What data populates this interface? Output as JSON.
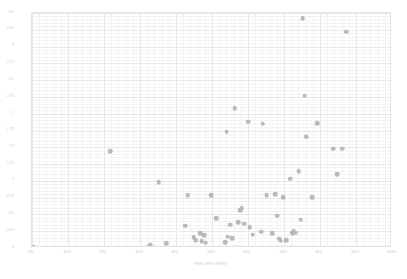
{
  "chart_data": {
    "type": "scatter",
    "title": "",
    "xlabel": "PERCENT WHITE",
    "ylabel": "CEMETERIES PER MILLION RESIDENTS",
    "xlim": [
      0,
      1
    ],
    "ylim": [
      0,
      3.5
    ],
    "xticks": [
      0,
      0.1,
      0.2,
      0.3,
      0.4,
      0.5,
      0.6,
      0.7,
      0.8,
      0.9,
      1
    ],
    "xticklabels": [
      "0%",
      "10%",
      "20%",
      "30%",
      "40%",
      "50%",
      "60%",
      "70%",
      "80%",
      "90%",
      "100%"
    ],
    "yticks": [
      0,
      0.25,
      0.5,
      0.75,
      1,
      1.25,
      1.5,
      1.75,
      2,
      2.25,
      2.5,
      2.75,
      3,
      3.25,
      3.5
    ],
    "yticklabels": [
      "0",
      "0.25",
      "0.5",
      "0.75",
      "1",
      "1.25",
      "1.5",
      "1.75",
      "2",
      "2.25",
      "2.5",
      "2.75",
      "3",
      "3.25",
      "3.5"
    ],
    "grid": true,
    "minor_grid": true,
    "legend": false,
    "marker_color": "#b6b9bd",
    "marker_size": 4.6,
    "series": [
      {
        "name": "states",
        "points": [
          [
            0.005,
            0.02
          ],
          [
            0.218,
            1.44
          ],
          [
            0.325,
            0.02
          ],
          [
            0.328,
            0.05
          ],
          [
            0.352,
            0.98
          ],
          [
            0.372,
            0.07
          ],
          [
            0.425,
            0.33
          ],
          [
            0.432,
            0.79
          ],
          [
            0.449,
            0.16
          ],
          [
            0.455,
            0.12
          ],
          [
            0.468,
            0.22
          ],
          [
            0.471,
            0.1
          ],
          [
            0.478,
            0.19
          ],
          [
            0.482,
            0.08
          ],
          [
            0.497,
            0.79
          ],
          [
            0.512,
            0.44
          ],
          [
            0.536,
            0.09
          ],
          [
            0.541,
            1.73
          ],
          [
            0.544,
            0.17
          ],
          [
            0.551,
            0.35
          ],
          [
            0.556,
            0.15
          ],
          [
            0.563,
            2.08
          ],
          [
            0.572,
            0.38
          ],
          [
            0.578,
            0.56
          ],
          [
            0.583,
            0.59
          ],
          [
            0.589,
            0.36
          ],
          [
            0.601,
            1.88
          ],
          [
            0.605,
            0.31
          ],
          [
            0.613,
            0.2
          ],
          [
            0.637,
            0.24
          ],
          [
            0.641,
            1.85
          ],
          [
            0.652,
            0.79
          ],
          [
            0.668,
            0.22
          ],
          [
            0.676,
            0.8
          ],
          [
            0.681,
            0.48
          ],
          [
            0.687,
            0.14
          ],
          [
            0.691,
            0.11
          ],
          [
            0.698,
            0.76
          ],
          [
            0.706,
            0.12
          ],
          [
            0.718,
            1.03
          ],
          [
            0.722,
            0.23
          ],
          [
            0.724,
            0.21
          ],
          [
            0.727,
            0.25
          ],
          [
            0.733,
            0.23
          ],
          [
            0.741,
            1.14
          ],
          [
            0.746,
            0.42
          ],
          [
            0.752,
            3.42
          ],
          [
            0.757,
            2.27
          ],
          [
            0.761,
            1.66
          ],
          [
            0.778,
            0.76
          ],
          [
            0.793,
            1.86
          ],
          [
            0.836,
            1.48
          ],
          [
            0.848,
            1.1
          ],
          [
            0.861,
            1.48
          ],
          [
            0.872,
            3.22
          ]
        ]
      }
    ]
  }
}
